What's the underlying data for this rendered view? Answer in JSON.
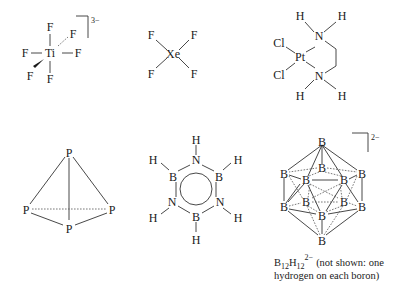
{
  "figure": {
    "structures": [
      {
        "id": "tif6",
        "name": "hexafluorotitanate",
        "center_atom": "Ti",
        "ligand": "F",
        "ligands": [
          "F",
          "F",
          "F",
          "F",
          "F",
          "F"
        ],
        "charge": "3−"
      },
      {
        "id": "xef4",
        "name": "xenon tetrafluoride",
        "center_atom": "Xe",
        "ligand": "F",
        "ligands": [
          "F",
          "F",
          "F",
          "F"
        ]
      },
      {
        "id": "pt-complex",
        "name": "dichloro(ethylenediamine)platinum",
        "center_atom": "Pt",
        "halogen": "Cl",
        "nitrogen": "N",
        "hydrogen": "H"
      },
      {
        "id": "p4",
        "name": "white phosphorus",
        "atom": "P"
      },
      {
        "id": "borazine",
        "name": "borazine",
        "boron": "B",
        "nitrogen": "N",
        "hydrogen": "H"
      },
      {
        "id": "b12h12",
        "name": "dodecaborate",
        "atom": "B",
        "charge": "2−",
        "caption": {
          "formula_b": "B",
          "sub1": "12",
          "formula_h": "H",
          "sub2": "12",
          "charge": "2−",
          "line1_rest": "(not shown: one",
          "line2": "hydrogen on each boron)"
        }
      }
    ]
  }
}
